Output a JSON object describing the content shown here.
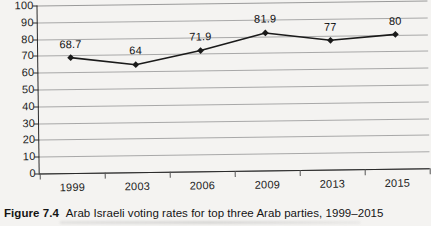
{
  "caption": {
    "figure_number": "Figure 7.4",
    "text": "Arab Israeli voting rates for top three Arab parties, 1999–2015"
  },
  "chart_data": {
    "type": "line",
    "title": "",
    "xlabel": "",
    "ylabel": "",
    "categories": [
      "1999",
      "2003",
      "2006",
      "2009",
      "2013",
      "2015"
    ],
    "values": [
      68.7,
      64,
      71.9,
      81.9,
      77,
      80
    ],
    "point_labels": [
      "68.7",
      "64",
      "71.9",
      "81.9",
      "77",
      "80"
    ],
    "ylim": [
      0,
      100
    ],
    "yticks": [
      0,
      10,
      20,
      30,
      40,
      50,
      60,
      70,
      80,
      90,
      100
    ],
    "ytick_labels": [
      "0",
      "10",
      "20",
      "30",
      "40",
      "50",
      "60",
      "70",
      "80",
      "90",
      "100"
    ],
    "grid": true,
    "grid_axis": "y",
    "legend": false,
    "marker": "diamond",
    "series_color": "#1a1a1a",
    "grid_color": "#a8a8a8",
    "axis_color": "#2a2a2a",
    "background": "#f4f3f1"
  }
}
